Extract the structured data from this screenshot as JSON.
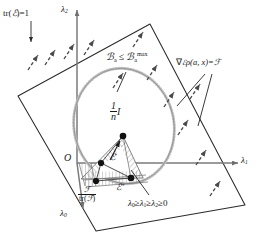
{
  "figure": {
    "kind": "geometric-diagram"
  },
  "axes": {
    "lambda2": {
      "label": "λ",
      "sub": "2",
      "name": "lambda2-axis"
    },
    "lambda1": {
      "label": "λ",
      "sub": "1",
      "name": "lambda1-axis"
    },
    "lambda0": {
      "label": "λ",
      "sub": "0",
      "name": "lambda0-axis"
    },
    "origin": "O"
  },
  "annotations": {
    "trace_constraint": {
      "prefix": "tr(",
      "symbol": "ℰ",
      "suffix": ")=1"
    },
    "d_constraint": {
      "text_left": "ℬ",
      "sub_left": "a",
      "rel": "≤",
      "text_right": "ℬ",
      "sub_right": "a",
      "sup_right": "max"
    },
    "gradient": {
      "text": "∇",
      "script": "ℰ",
      "rest": "ρ(a, x)=",
      "result": "ℱ"
    },
    "ordering": {
      "text": "λ",
      "s0": "0",
      "ge1": "≥",
      "l1": "λ",
      "s1": "1",
      "ge2": "≥",
      "l2": "λ",
      "s2": "2",
      "ge3": "≥",
      "zero": "0"
    },
    "identity_point": {
      "num": "1",
      "den": "n",
      "suffix": "I"
    },
    "s_over_trs": {
      "num": "ℱ",
      "den_prefix": "tr(",
      "den_symbol": "ℱ",
      "den_suffix": ")"
    },
    "a_prime": {
      "symbol": "ℰ",
      "prime": "′"
    },
    "a_double_prime": {
      "symbol": "ℰ",
      "prime": "″"
    }
  },
  "colors": {
    "ink": "#1a1a1a",
    "axis": "#7a7a7a",
    "plane_edge": "#2b2b2b",
    "ellipse": "#b9b9b9",
    "hatch": "#9a9a9a",
    "dot": "#111111"
  }
}
